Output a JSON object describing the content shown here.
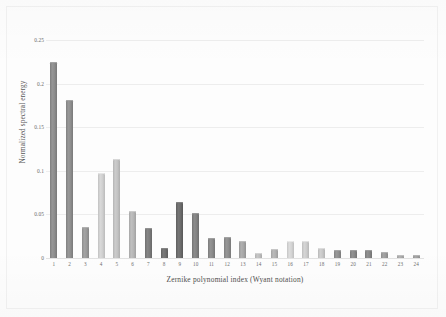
{
  "chart_data": {
    "type": "bar",
    "title": "",
    "xlabel": "Zernike polynomial index (Wyant notation)",
    "ylabel": "Normalized spectral energy",
    "categories": [
      "1",
      "2",
      "3",
      "4",
      "5",
      "6",
      "7",
      "8",
      "9",
      "10",
      "11",
      "12",
      "13",
      "14",
      "15",
      "16",
      "17",
      "18",
      "19",
      "20",
      "21",
      "22",
      "23",
      "24"
    ],
    "values": [
      0.225,
      0.181,
      0.036,
      0.098,
      0.113,
      0.054,
      0.034,
      0.011,
      0.064,
      0.052,
      0.023,
      0.024,
      0.02,
      0.006,
      0.01,
      0.02,
      0.02,
      0.011,
      0.009,
      0.009,
      0.009,
      0.007,
      0.004,
      0.003
    ],
    "ylim": [
      0,
      0.25
    ],
    "yticks": [
      0,
      0.05,
      0.1,
      0.15,
      0.2,
      0.25
    ],
    "ytick_labels": [
      "0",
      "0.05",
      "0.1",
      "0.15",
      "0.2",
      "0.25"
    ],
    "grid": true,
    "legend": "none",
    "bar_colors": [
      "#8c8c8c",
      "#8e8e8e",
      "#9a9a9a",
      "#cfcfcf",
      "#c2c2c2",
      "#b5b5b5",
      "#7c7c7c",
      "#6f6f6f",
      "#6c6c6c",
      "#828282",
      "#8a8a8a",
      "#8d8d8d",
      "#a6a6a6",
      "#bdbdbd",
      "#b0b0b0",
      "#d3d3d3",
      "#cbcbcb",
      "#c7c7c7",
      "#8f8f8f",
      "#888888",
      "#868686",
      "#9b9b9b",
      "#a9a9a9",
      "#9e9e9e"
    ],
    "axis_color": "#e2e2e2",
    "grid_color": "#ededed",
    "text_color": "#5a5a5a",
    "background": "#fdfdfd"
  }
}
